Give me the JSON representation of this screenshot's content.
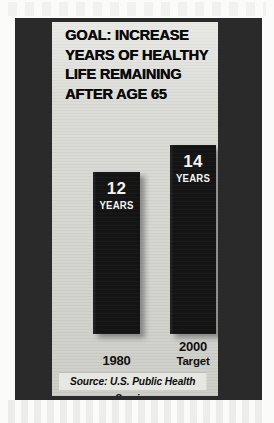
{
  "graphic": {
    "headline_lines": [
      "GOAL: INCREASE",
      "YEARS OF HEALTHY",
      "LIFE REMAINING",
      "AFTER AGE 65"
    ],
    "source_note": "Source: U.S. Public Health Service",
    "colors": {
      "frame": "#2a2a2a",
      "panel": "#d7d7d2",
      "bar": "#141414",
      "bar_text": "#f2f2f0",
      "source_band": "#e6e6e2",
      "headline_text": "#0a0a0a"
    }
  },
  "chart_data": {
    "type": "bar",
    "title": "GOAL: INCREASE YEARS OF HEALTHY LIFE REMAINING AFTER AGE 65",
    "categories": [
      "1980",
      "2000"
    ],
    "category_sublabels": [
      "",
      "Target"
    ],
    "values": [
      12,
      14
    ],
    "value_labels": [
      "12",
      "14"
    ],
    "unit_labels": [
      "YEARS",
      "YEARS"
    ],
    "xlabel": "",
    "ylabel": "Years of healthy life remaining after age 65",
    "ylim": [
      0,
      16
    ],
    "grid": false,
    "legend": "none",
    "annotations": [
      "Source: U.S. Public Health Service"
    ]
  }
}
